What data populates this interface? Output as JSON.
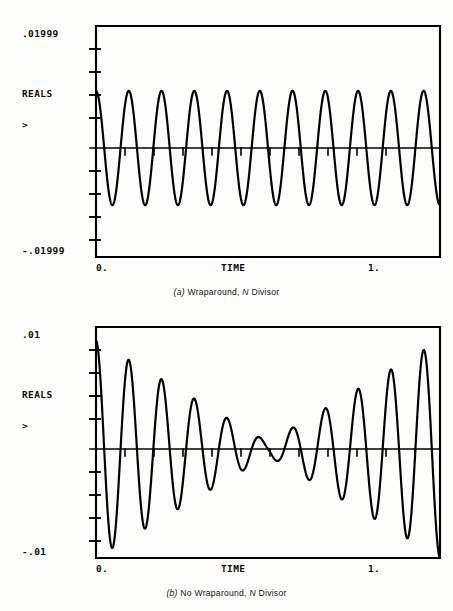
{
  "figures": [
    {
      "id": "figure-a",
      "y_top_label": ".01999",
      "y_series_label": "REALS",
      "y_cursor_label": ">",
      "y_bottom_label": "-.01999",
      "x_left_label": "0.",
      "x_axis_label": "TIME",
      "x_right_label": "1.",
      "caption_tag": "(a)",
      "caption_text": "Wraparound,",
      "caption_italic": "N",
      "caption_tail": "Divisor",
      "chart_data": {
        "type": "line",
        "title": "(a) Wraparound, N Divisor",
        "xlabel": "TIME",
        "ylabel": "REALS",
        "xlim": [
          0.0,
          1.2
        ],
        "ylim": [
          -0.01999,
          0.01999
        ],
        "xticks": [
          0.0,
          1.0
        ],
        "xticklabels": [
          "0.",
          "1."
        ],
        "yticklabels": [
          ".01999",
          "-.01999"
        ],
        "grid": false,
        "legend": false,
        "envelope": "constant",
        "cycles": 10.5,
        "description": "Constant-amplitude sinusoid, approximately 10.5 cycles across the plotted interval, amplitude near 0.0085 of full scale with flat envelope.",
        "series": [
          {
            "name": "REALS",
            "color": "#000000",
            "amplitude": 0.0102,
            "frequency_cycles": 10.5,
            "phase_deg": 90,
            "values_note": "x in [0,1.2], y = 0.0102 * cos(2*pi*10.5*x/1.2)"
          }
        ]
      }
    },
    {
      "id": "figure-b",
      "y_top_label": ".01",
      "y_series_label": "REALS",
      "y_cursor_label": ">",
      "y_bottom_label": "-.01",
      "x_left_label": "0.",
      "x_axis_label": "TIME",
      "x_right_label": "1.",
      "caption_tag": "(b)",
      "caption_text": "No Wraparound,",
      "caption_italic": "N",
      "caption_tail": "Divisor",
      "chart_data": {
        "type": "line",
        "title": "(b) No Wraparound, N Divisor",
        "xlabel": "TIME",
        "ylabel": "REALS",
        "xlim": [
          0.0,
          1.2
        ],
        "ylim": [
          -0.01,
          0.01
        ],
        "xticks": [
          0.0,
          1.0
        ],
        "xticklabels": [
          "0.",
          "1."
        ],
        "yticklabels": [
          ".01",
          "-.01"
        ],
        "grid": false,
        "legend": false,
        "envelope": "triangular-decay-to-center",
        "cycles": 10.5,
        "description": "Amplitude-modulated sinusoid: envelope is largest at both ends and decays almost to zero at the mid-point of the record, producing a beat / triangular-window appearance. Same carrier frequency as (a), about 10.5 cycles.",
        "series": [
          {
            "name": "REALS",
            "color": "#000000",
            "amplitude_max": 0.0097,
            "amplitude_center": 0.0006,
            "frequency_cycles": 10.5,
            "phase_deg": 90,
            "values_note": "x in [0,1.2], y = 0.0097 * |1 - 2x/1.2| * cos(2*pi*10.5*x/1.2)"
          }
        ]
      }
    }
  ],
  "geometry": {
    "plot_left": 96,
    "plot_right": 440,
    "upper_plot_top": 26,
    "upper_plot_bottom": 257,
    "lower_plot_top": 327,
    "lower_plot_bottom": 558,
    "y_tick_count": 10,
    "x_tick_count": 12,
    "line_color": "#000000"
  }
}
